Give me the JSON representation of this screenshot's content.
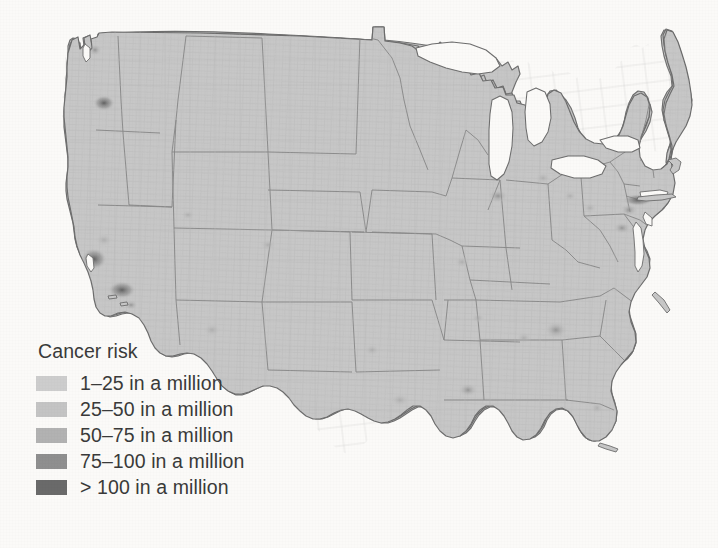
{
  "figure": {
    "kind": "choropleth-map",
    "region": "contiguous-united-states",
    "background_color": "#fbfaf8",
    "land_fill": "#c6c6c6",
    "water_fill": "#fbfaf8",
    "state_border_color": "#8c8c8c",
    "county_border_color": "#b4b4b4",
    "coast_outline_color": "#6f6f6f"
  },
  "legend": {
    "title": "Cancer risk",
    "items": [
      {
        "label": "1–25 in a million",
        "color": "#cdcdcd",
        "min": 1,
        "max": 25
      },
      {
        "label": "25–50 in a million",
        "color": "#c4c4c4",
        "min": 25,
        "max": 50
      },
      {
        "label": "50–75 in a million",
        "color": "#b2b2b2",
        "min": 50,
        "max": 75
      },
      {
        "label": "75–100 in a million",
        "color": "#8f8f8f",
        "min": 75,
        "max": 100
      },
      {
        "label": "> 100 in a million",
        "color": "#6a6a6a",
        "min": 100,
        "max": null
      }
    ]
  },
  "hotspots": [
    {
      "name": "portland-or",
      "level": "> 100 in a million"
    },
    {
      "name": "san-francisco-bay",
      "level": "> 100 in a million"
    },
    {
      "name": "los-angeles",
      "level": "> 100 in a million"
    },
    {
      "name": "new-york-city",
      "level": "> 100 in a million"
    },
    {
      "name": "atlanta",
      "level": "75–100 in a million"
    },
    {
      "name": "gulf-coast-la",
      "level": "75–100 in a million"
    },
    {
      "name": "chicago",
      "level": "50–75 in a million"
    },
    {
      "name": "philadelphia",
      "level": "75–100 in a million"
    }
  ]
}
